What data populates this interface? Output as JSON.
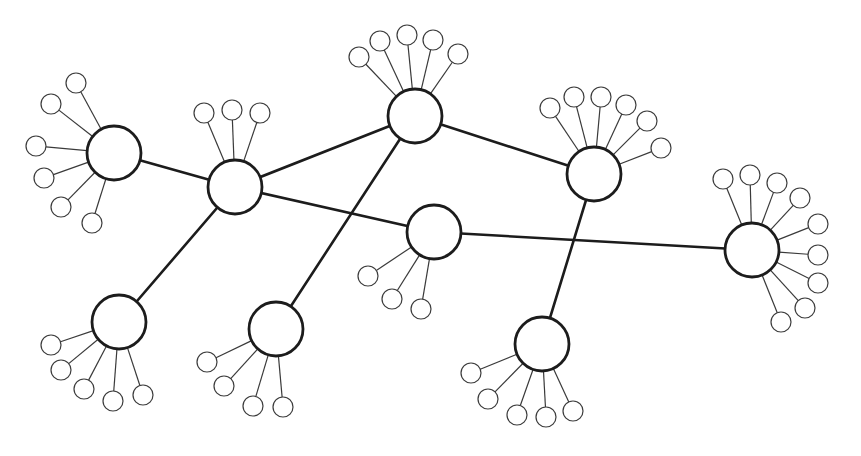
{
  "diagram": {
    "type": "network",
    "colors": {
      "stroke": "#1c1c1c",
      "fill": "#ffffff",
      "background": "#ffffff"
    },
    "hubs": [
      {
        "id": "h1",
        "leaves": 6
      },
      {
        "id": "h2",
        "leaves": 3
      },
      {
        "id": "h3",
        "leaves": 5
      },
      {
        "id": "h4",
        "leaves": 6
      },
      {
        "id": "h5",
        "leaves": 3
      },
      {
        "id": "h6",
        "leaves": 9
      },
      {
        "id": "h7",
        "leaves": 5
      },
      {
        "id": "h8",
        "leaves": 4
      },
      {
        "id": "h9",
        "leaves": 5
      }
    ],
    "edges": [
      [
        "h1",
        "h2"
      ],
      [
        "h2",
        "h3"
      ],
      [
        "h2",
        "h5"
      ],
      [
        "h2",
        "h7"
      ],
      [
        "h3",
        "h4"
      ],
      [
        "h3",
        "h8"
      ],
      [
        "h4",
        "h9"
      ],
      [
        "h5",
        "h6"
      ]
    ]
  }
}
